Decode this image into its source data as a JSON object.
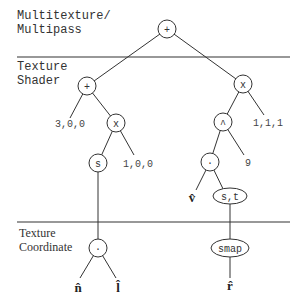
{
  "sections": [
    {
      "label_line1": "Multitexture/",
      "label_line2": "Multipass"
    },
    {
      "label_line1": "Texture",
      "label_line2": "Shader"
    },
    {
      "label_line1": "Texture",
      "label_line2": "Coordinate"
    }
  ],
  "nodes": {
    "root": "+",
    "shader_plus": "+",
    "shader_mult_left": "x",
    "shader_mult_right": "x",
    "s": "s",
    "pow": "^",
    "dot_shader": "·",
    "st": "s,t",
    "dot_coord": "·",
    "smap": "smap"
  },
  "leaves": {
    "c300": "3,0,0",
    "c100": "1,0,0",
    "c111": "1,1,1",
    "nine": "9",
    "v": "v̂",
    "n": "n̂",
    "l": "l̂",
    "r": "r̂"
  }
}
